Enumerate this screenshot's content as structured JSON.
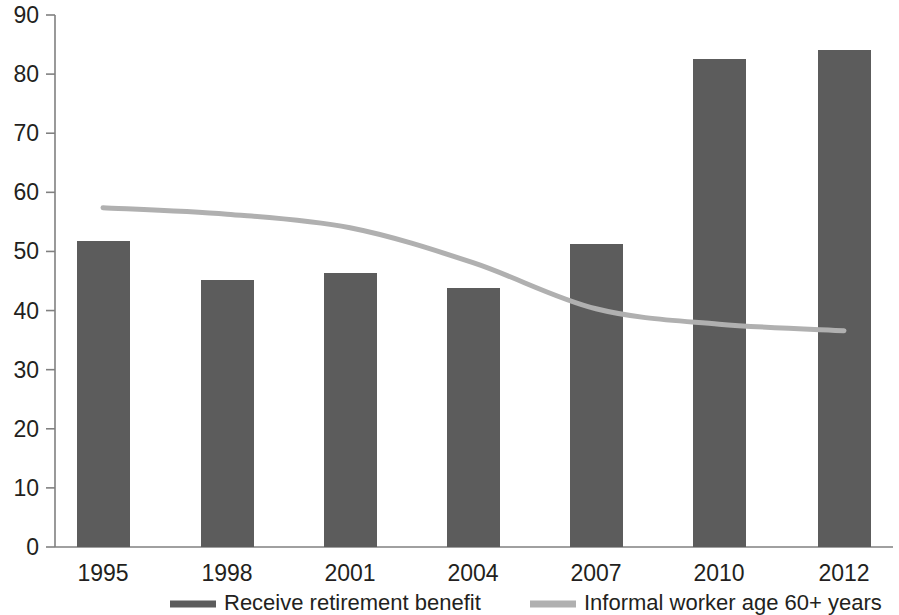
{
  "chart_data": {
    "type": "bar",
    "title": "",
    "subtitle": "",
    "xlabel": "",
    "ylabel": "",
    "categories": [
      "1995",
      "1998",
      "2001",
      "2004",
      "2007",
      "2010",
      "2012"
    ],
    "ylim": [
      0,
      90
    ],
    "y_ticks": [
      "0",
      "10",
      "20",
      "30",
      "40",
      "50",
      "60",
      "70",
      "80",
      "90"
    ],
    "y_tick_values": [
      0,
      10,
      20,
      30,
      40,
      50,
      60,
      70,
      80,
      90
    ],
    "grid": false,
    "legend_position": "bottom",
    "series": [
      {
        "name": "Receive retirement benefit",
        "type": "bar",
        "color": "#5c5c5c",
        "values": [
          51.7,
          45.2,
          46.3,
          43.8,
          51.2,
          82.5,
          84.1
        ]
      },
      {
        "name": "Informal worker age 60+ years",
        "type": "line",
        "color": "#b0b0b0",
        "values": [
          57.4,
          56.3,
          54.0,
          48.1,
          40.3,
          37.7,
          36.6
        ]
      }
    ]
  },
  "legend": {
    "items": [
      {
        "label": "Receive retirement benefit",
        "color": "#5c5c5c"
      },
      {
        "label": "Informal worker age 60+ years",
        "color": "#b0b0b0"
      }
    ]
  },
  "axes": {
    "y_axis_name": "y-axis",
    "x_axis_name": "x-axis"
  }
}
